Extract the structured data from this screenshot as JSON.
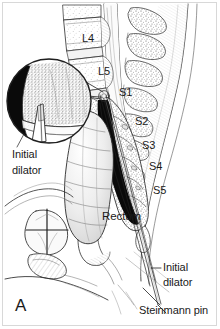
{
  "figure": {
    "panel_letter": "A",
    "border_color": "#d8d8d8",
    "ink_color": "#1a1a1a",
    "background_color": "#ffffff",
    "caption_note": ""
  },
  "vertebrae": [
    {
      "id": "l4",
      "label": "L4"
    },
    {
      "id": "l5",
      "label": "L5"
    },
    {
      "id": "s1",
      "label": "S1"
    },
    {
      "id": "s2",
      "label": "S2"
    },
    {
      "id": "s3",
      "label": "S3"
    },
    {
      "id": "s4",
      "label": "S4"
    },
    {
      "id": "s5",
      "label": "S5"
    }
  ],
  "organs": [
    {
      "id": "rectum",
      "label": "Rectum"
    }
  ],
  "callouts": [
    {
      "id": "initial-dilator-inset",
      "line1": "Initial",
      "line2": "dilator"
    },
    {
      "id": "initial-dilator-distal",
      "line1": "Initial",
      "line2": "dilator"
    },
    {
      "id": "steinmann-pin",
      "line1": "Steinmann pin",
      "line2": ""
    }
  ],
  "inset": {
    "id": "magnified-bone-inset",
    "description": "magnified circular view of cancellous bone with dilator tip"
  }
}
